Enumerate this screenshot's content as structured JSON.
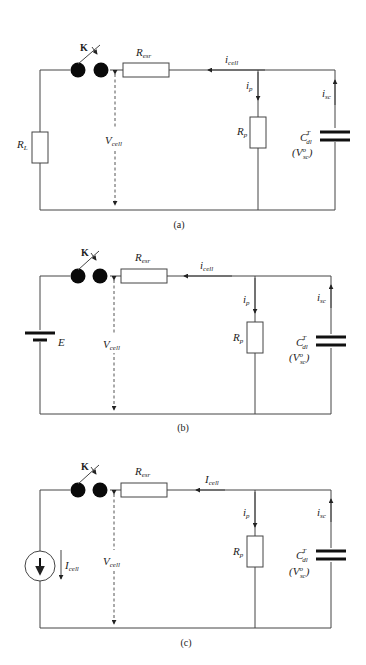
{
  "figure": {
    "panels": [
      {
        "caption": "(a)",
        "source_label": "R",
        "source_sub": "L",
        "source_type": "resistor",
        "switch_label": "K",
        "resr_label": "R",
        "resr_sub": "esr",
        "icell_label": "i",
        "icell_sub": "cell",
        "ip_label": "i",
        "ip_sub": "p",
        "isc_label": "i",
        "isc_sub": "sc",
        "rp_label": "R",
        "rp_sub": "p",
        "vcell_label": "V",
        "vcell_sub": "cell",
        "cap_label": "C",
        "cap_sup": "T",
        "cap_sub": "dl",
        "cap_v_label": "(V",
        "cap_v_sup": "o",
        "cap_v_sub": "sc",
        "cap_v_close": ")"
      },
      {
        "caption": "(b)",
        "source_label": "E",
        "source_type": "battery",
        "switch_label": "K",
        "resr_label": "R",
        "resr_sub": "esr",
        "icell_label": "i",
        "icell_sub": "cell",
        "ip_label": "i",
        "ip_sub": "p",
        "isc_label": "i",
        "isc_sub": "sc",
        "rp_label": "R",
        "rp_sub": "p",
        "vcell_label": "V",
        "vcell_sub": "cell",
        "cap_label": "C",
        "cap_sup": "T",
        "cap_sub": "dl",
        "cap_v_label": "(V",
        "cap_v_sup": "o",
        "cap_v_sub": "sc",
        "cap_v_close": ")"
      },
      {
        "caption": "(c)",
        "source_label": "I",
        "source_sub": "cell",
        "source_type": "current-source",
        "switch_label": "K",
        "resr_label": "R",
        "resr_sub": "esr",
        "icell_label": "I",
        "icell_sub": "cell",
        "ip_label": "i",
        "ip_sub": "p",
        "isc_label": "i",
        "isc_sub": "sc",
        "rp_label": "R",
        "rp_sub": "p",
        "vcell_label": "V",
        "vcell_sub": "cell",
        "cap_label": "C",
        "cap_sup": "T",
        "cap_sub": "dl",
        "cap_v_label": "(V",
        "cap_v_sup": "o",
        "cap_v_sub": "sc",
        "cap_v_close": ")"
      }
    ]
  }
}
